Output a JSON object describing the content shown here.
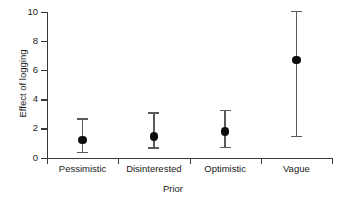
{
  "chart_data": {
    "type": "scatter",
    "title": "",
    "xlabel": "Prior",
    "ylabel": "Effect of logging",
    "categories": [
      "Pessimistic",
      "Disinterested",
      "Optimistic",
      "Vague"
    ],
    "values": [
      1.2,
      1.45,
      1.8,
      6.7
    ],
    "error_low": [
      0.4,
      0.7,
      0.75,
      1.5
    ],
    "error_high": [
      2.7,
      3.1,
      3.3,
      10.1
    ],
    "ylim": [
      0,
      10
    ],
    "ytick_labels": [
      "0",
      "2",
      "4",
      "6",
      "8",
      "10"
    ],
    "ytick_values": [
      0,
      2,
      4,
      6,
      8,
      10
    ],
    "grid": false,
    "legend": false,
    "marker": "filled-circle",
    "marker_color": "#0d0d0d",
    "errorbar_color": "#5a5a5a",
    "axis_color": "#3a3a3a",
    "series_name": "Effect of logging"
  }
}
